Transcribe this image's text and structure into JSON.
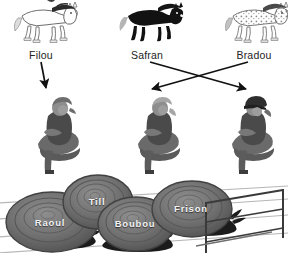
{
  "page": {
    "width": 288,
    "height": 253,
    "background": "#ffffff",
    "label_color": "#222222",
    "line_color": "#111111",
    "snail_label_color": "#f2f2f2"
  },
  "horses": {
    "section_name": "horses-row",
    "items": [
      {
        "name": "Filou",
        "coat": "white-outline",
        "label": "Filou",
        "x": 42,
        "y": 22,
        "label_x": 41,
        "label_y": 49,
        "body": "#fdfdfd",
        "stroke": "#6d6d6d",
        "mane": "#2b2b2b",
        "tail": "#d9d9d9"
      },
      {
        "name": "Safran",
        "coat": "black",
        "label": "Safran",
        "x": 148,
        "y": 22,
        "label_x": 147,
        "label_y": 49,
        "body": "#121212",
        "stroke": "#121212",
        "mane": "#151515",
        "tail": "#b5b5b5"
      },
      {
        "name": "Bradou",
        "coat": "dappled-grey",
        "label": "Bradou",
        "x": 253,
        "y": 22,
        "label_x": 254,
        "label_y": 49,
        "body": "#fcfcfc",
        "stroke": "#777777",
        "mane": "#4a4a4a",
        "tail": "#b9b9b9"
      }
    ]
  },
  "arrows": {
    "section_name": "arrow-connectors",
    "items": [
      {
        "id": "filou-to-rider-left",
        "from_label": "Filou",
        "to_rider": "rider-left",
        "x1": 41,
        "y1": 62,
        "x2": 45,
        "y2": 92,
        "kind": "straight-down"
      },
      {
        "id": "safran-to-rider-right",
        "from_label": "Safran",
        "to_rider": "rider-right",
        "x1": 150,
        "y1": 62,
        "x2": 247,
        "y2": 92,
        "kind": "crossing"
      },
      {
        "id": "bradou-to-rider-mid",
        "from_label": "Bradou",
        "to_rider": "rider-middle",
        "x1": 248,
        "y1": 62,
        "x2": 152,
        "y2": 92,
        "kind": "crossing"
      }
    ]
  },
  "riders": {
    "section_name": "riders-row",
    "items": [
      {
        "id": "rider-left",
        "x": 58,
        "y": 100,
        "hair": "ponytail",
        "helmet": false,
        "facing": "left"
      },
      {
        "id": "rider-middle",
        "x": 158,
        "y": 100,
        "hair": "ponytail",
        "helmet": false,
        "facing": "left"
      },
      {
        "id": "rider-right",
        "x": 252,
        "y": 100,
        "hair": "ponytail",
        "helmet": true,
        "facing": "left"
      }
    ]
  },
  "snails": {
    "section_name": "snail-race",
    "track_lines": 4,
    "hurdle": {
      "name": "hurdle",
      "x": 205,
      "y": 200,
      "width": 80,
      "height": 45
    },
    "items": [
      {
        "name": "Raoul",
        "label": "Raoul",
        "x": 52,
        "y": 222,
        "rx": 48,
        "ry": 31,
        "label_x": 50,
        "label_y": 222,
        "shell": "#6f6f6f"
      },
      {
        "name": "Till",
        "label": "Till",
        "x": 98,
        "y": 202,
        "rx": 36,
        "ry": 28,
        "label_x": 97,
        "label_y": 201,
        "shell": "#747474"
      },
      {
        "name": "Boubou",
        "label": "Boubou",
        "x": 136,
        "y": 224,
        "rx": 39,
        "ry": 28,
        "label_x": 135,
        "label_y": 223,
        "shell": "#707070"
      },
      {
        "name": "Frison",
        "label": "Frison",
        "x": 192,
        "y": 209,
        "rx": 41,
        "ry": 29,
        "label_x": 191,
        "label_y": 208,
        "shell": "#6b6b6b"
      }
    ]
  }
}
